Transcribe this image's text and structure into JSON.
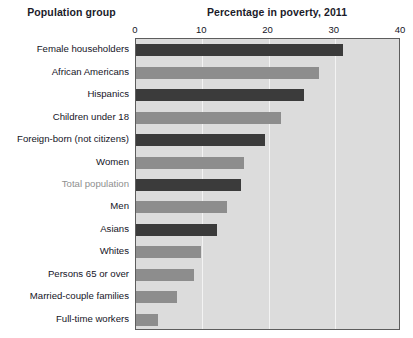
{
  "header": {
    "left_title": "Population group",
    "right_title": "Percentage in poverty, 2011"
  },
  "chart_data": {
    "type": "bar",
    "orientation": "horizontal",
    "title": "Percentage in poverty, 2011",
    "xlabel": "",
    "ylabel": "Population group",
    "xlim": [
      0,
      40
    ],
    "ticks": [
      0,
      10,
      20,
      30,
      40
    ],
    "tick_labels": [
      "0",
      "10",
      "20",
      "30",
      "40"
    ],
    "grid": true,
    "legend": "none",
    "plot_background": "#dcdcdc",
    "colors": {
      "dark": "#3b3b3b",
      "medium": "#8d8d8d",
      "highlight_label": "#8f8f8f"
    },
    "categories": [
      "Female householders",
      "African Americans",
      "Hispanics",
      "Children under 18",
      "Foreign-born (not citizens)",
      "Women",
      "Total population",
      "Men",
      "Asians",
      "Whites",
      "Persons 65 or over",
      "Married-couple families",
      "Full-time workers"
    ],
    "values": [
      31.2,
      27.6,
      25.3,
      21.9,
      19.5,
      16.3,
      15.9,
      13.8,
      12.3,
      9.8,
      8.7,
      6.2,
      3.3
    ],
    "bar_shades": [
      "dark",
      "medium",
      "dark",
      "medium",
      "dark",
      "medium",
      "dark",
      "medium",
      "dark",
      "medium",
      "medium",
      "medium",
      "medium"
    ],
    "label_styles": [
      "normal",
      "normal",
      "normal",
      "normal",
      "normal",
      "normal",
      "muted",
      "normal",
      "normal",
      "normal",
      "normal",
      "normal",
      "normal"
    ]
  }
}
